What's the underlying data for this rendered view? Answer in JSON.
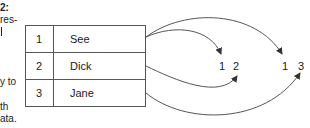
{
  "side_text": {
    "line1": "2:",
    "line2": "res-",
    "line3": "",
    "line4": "y to",
    "line5": "th",
    "line6": "ata."
  },
  "table": {
    "rows": [
      {
        "index": "1",
        "value": "See"
      },
      {
        "index": "2",
        "value": "Dick"
      },
      {
        "index": "3",
        "value": "Jane"
      }
    ]
  },
  "groups": [
    {
      "name": "group-a",
      "labels": [
        "1",
        "2"
      ]
    },
    {
      "name": "group-b",
      "labels": [
        "1",
        "3"
      ]
    }
  ],
  "colors": {
    "line": "#555555",
    "border": "#555555",
    "text": "#1a1a1a"
  }
}
